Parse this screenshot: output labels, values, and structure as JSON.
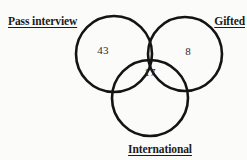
{
  "diagram": {
    "type": "venn-3-set",
    "background_color": "#fbfbfa",
    "stroke_color": "#141414",
    "title": "",
    "sets": [
      {
        "id": "pass-interview",
        "label": "Pass interview",
        "position": "top-left",
        "center": [
          114,
          54
        ],
        "radius": 38
      },
      {
        "id": "gifted",
        "label": "Gifted",
        "position": "top-right",
        "center": [
          185,
          54
        ],
        "radius": 37
      },
      {
        "id": "international",
        "label": "International",
        "position": "bottom-center",
        "center": [
          150,
          98
        ],
        "radius": 38
      }
    ],
    "regions": [
      {
        "id": "pass-interview-only",
        "label": "43",
        "value": 43,
        "belongs_to": [
          "pass-interview"
        ],
        "center": [
          103,
          50
        ]
      },
      {
        "id": "gifted-only",
        "label": "8",
        "value": 8,
        "belongs_to": [
          "gifted"
        ],
        "center": [
          188,
          51
        ]
      },
      {
        "id": "all-three",
        "label": "17",
        "value": 17,
        "belongs_to": [
          "pass-interview",
          "gifted",
          "international"
        ],
        "center": [
          150,
          72
        ]
      }
    ]
  }
}
